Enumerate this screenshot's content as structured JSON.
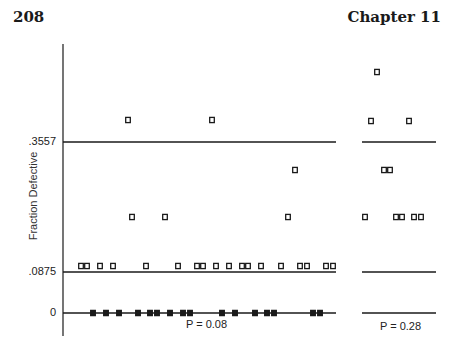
{
  "header": {
    "page_number": "208",
    "chapter": "Chapter 11"
  },
  "chart_data": [
    {
      "type": "scatter",
      "title": "",
      "xlabel": "P = 0.08",
      "ylabel": "Fraction Defective",
      "yticks": [
        ".3557",
        ".0875",
        "0"
      ],
      "control_limits": {
        "upper": 0.3557,
        "lower": 0.0875,
        "center_zero": 0
      },
      "grid": false,
      "ylim": [
        0,
        0.55
      ],
      "points": [
        {
          "x": 1,
          "y": 0.1
        },
        {
          "x": 2,
          "y": 0.1
        },
        {
          "x": 3,
          "y": 0
        },
        {
          "x": 4,
          "y": 0.1
        },
        {
          "x": 5,
          "y": 0
        },
        {
          "x": 6,
          "y": 0.1
        },
        {
          "x": 7,
          "y": 0
        },
        {
          "x": 8,
          "y": 0.4
        },
        {
          "x": 9,
          "y": 0.2
        },
        {
          "x": 10,
          "y": 0
        },
        {
          "x": 11,
          "y": 0.1
        },
        {
          "x": 12,
          "y": 0
        },
        {
          "x": 13,
          "y": 0
        },
        {
          "x": 14,
          "y": 0.2
        },
        {
          "x": 15,
          "y": 0
        },
        {
          "x": 16,
          "y": 0.1
        },
        {
          "x": 17,
          "y": 0
        },
        {
          "x": 18,
          "y": 0
        },
        {
          "x": 19,
          "y": 0.1
        },
        {
          "x": 20,
          "y": 0.1
        },
        {
          "x": 21,
          "y": 0.4
        },
        {
          "x": 22,
          "y": 0.1
        },
        {
          "x": 23,
          "y": 0
        },
        {
          "x": 24,
          "y": 0.1
        },
        {
          "x": 25,
          "y": 0
        },
        {
          "x": 26,
          "y": 0.1
        },
        {
          "x": 27,
          "y": 0.1
        },
        {
          "x": 28,
          "y": 0
        },
        {
          "x": 29,
          "y": 0.1
        },
        {
          "x": 30,
          "y": 0
        },
        {
          "x": 31,
          "y": 0
        },
        {
          "x": 32,
          "y": 0.1
        },
        {
          "x": 33,
          "y": 0.2
        },
        {
          "x": 34,
          "y": 0.3
        },
        {
          "x": 35,
          "y": 0.1
        },
        {
          "x": 36,
          "y": 0.1
        },
        {
          "x": 37,
          "y": 0
        },
        {
          "x": 38,
          "y": 0
        },
        {
          "x": 39,
          "y": 0.1
        },
        {
          "x": 40,
          "y": 0.1
        }
      ]
    },
    {
      "type": "scatter",
      "title": "",
      "xlabel": "P = 0.28",
      "ylabel": "Fraction Defective",
      "control_limits": {
        "upper": 0.3557,
        "lower": 0.0875,
        "center_zero": 0
      },
      "grid": false,
      "ylim": [
        0,
        0.55
      ],
      "points": [
        {
          "x": 1,
          "y": 0.2
        },
        {
          "x": 2,
          "y": 0.4
        },
        {
          "x": 3,
          "y": 0.5
        },
        {
          "x": 4,
          "y": 0.3
        },
        {
          "x": 5,
          "y": 0.3
        },
        {
          "x": 6,
          "y": 0.2
        },
        {
          "x": 7,
          "y": 0.2
        },
        {
          "x": 8,
          "y": 0.4
        },
        {
          "x": 9,
          "y": 0.2
        },
        {
          "x": 10,
          "y": 0.2
        }
      ]
    }
  ],
  "render": {
    "ink": "#1a1a1a",
    "axis": {
      "x": 63,
      "y_top": 44,
      "y_bottom": 336
    },
    "y_px": {
      "zero": 313,
      "lcl": 272,
      "ucl": 142,
      "per_unit": 480.7
    },
    "left_panel": {
      "x_start": 63,
      "x_end": 336,
      "label_x": 186,
      "label_y": 318
    },
    "right_panel": {
      "x_start": 362,
      "x_end": 436,
      "label_x": 380,
      "label_y": 320
    },
    "left_points_px": [
      [
        81,
        266
      ],
      [
        87,
        266
      ],
      [
        93,
        313
      ],
      [
        100,
        266
      ],
      [
        106,
        313
      ],
      [
        113,
        266
      ],
      [
        119,
        313
      ],
      [
        128,
        120
      ],
      [
        132,
        217
      ],
      [
        138,
        313
      ],
      [
        146,
        266
      ],
      [
        150,
        313
      ],
      [
        157,
        313
      ],
      [
        165,
        217
      ],
      [
        170,
        313
      ],
      [
        178,
        266
      ],
      [
        183,
        313
      ],
      [
        190,
        313
      ],
      [
        197,
        266
      ],
      [
        203,
        266
      ],
      [
        212,
        120
      ],
      [
        216,
        266
      ],
      [
        222,
        313
      ],
      [
        229,
        266
      ],
      [
        235,
        313
      ],
      [
        242,
        266
      ],
      [
        248,
        266
      ],
      [
        255,
        313
      ],
      [
        261,
        266
      ],
      [
        267,
        313
      ],
      [
        274,
        313
      ],
      [
        281,
        266
      ],
      [
        288,
        217
      ],
      [
        295,
        170
      ],
      [
        300,
        266
      ],
      [
        307,
        266
      ],
      [
        313,
        313
      ],
      [
        320,
        313
      ],
      [
        326,
        266
      ],
      [
        333,
        266
      ]
    ],
    "right_points_px": [
      [
        365,
        217
      ],
      [
        371,
        121
      ],
      [
        377,
        72
      ],
      [
        384,
        170
      ],
      [
        390,
        170
      ],
      [
        396,
        217
      ],
      [
        402,
        217
      ],
      [
        409,
        121
      ],
      [
        414,
        217
      ],
      [
        421,
        217
      ]
    ]
  }
}
